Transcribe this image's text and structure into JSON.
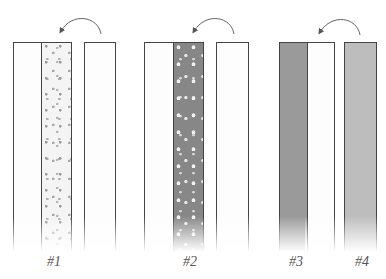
{
  "diagram": {
    "groups": [
      {
        "id": "1",
        "label": "#1",
        "strips": [
          {
            "role": "left-plain",
            "fill": "plain"
          },
          {
            "role": "folded-print",
            "fill": "light-floral-print"
          },
          {
            "role": "right-plain",
            "fill": "plain"
          }
        ],
        "arrow": "curved-arrow-right-to-left"
      },
      {
        "id": "2",
        "label": "#2",
        "strips": [
          {
            "role": "left-plain",
            "fill": "plain"
          },
          {
            "role": "folded-print",
            "fill": "dark-dotted-print"
          },
          {
            "role": "right-plain",
            "fill": "plain"
          }
        ],
        "arrow": "curved-arrow-right-to-left"
      },
      {
        "id": "3",
        "label": "#3",
        "strips": [
          {
            "role": "left-solid",
            "fill": "dark-gray"
          },
          {
            "role": "right-plain",
            "fill": "plain"
          }
        ],
        "arrow": "curved-arrow-right-to-left"
      },
      {
        "id": "4",
        "label": "#4",
        "strips": [
          {
            "role": "solid",
            "fill": "light-gray"
          }
        ]
      }
    ],
    "colors": {
      "outline": "#444444",
      "plain": "#fdfdfd",
      "print1_bg": "#f4f4f4",
      "print2_bg": "#878787",
      "dark_gray": "#9a9a9a",
      "light_gray": "#bdbdbd",
      "label": "#555555"
    }
  }
}
